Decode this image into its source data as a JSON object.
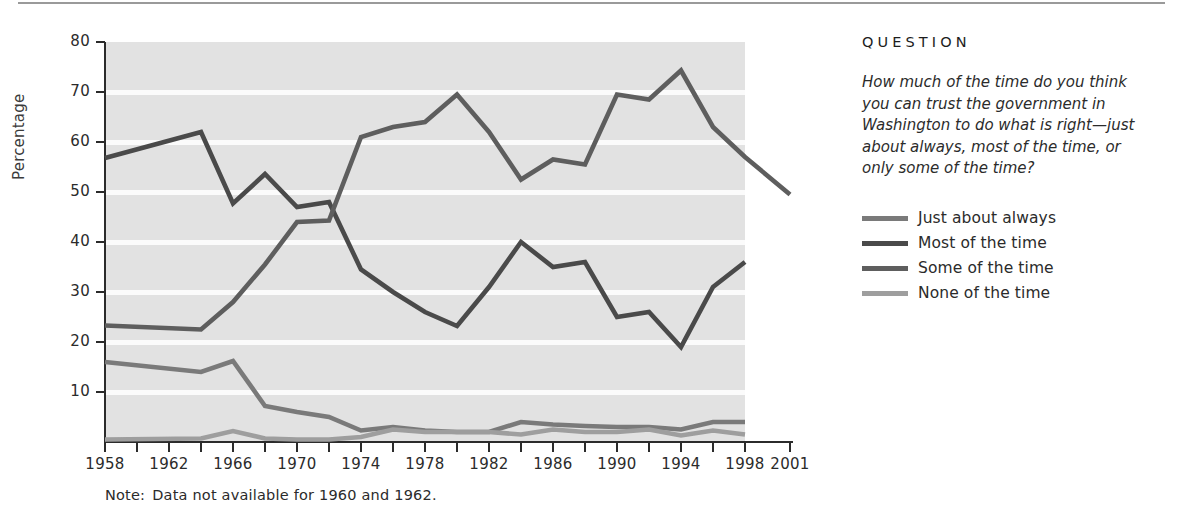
{
  "figure": {
    "note": "Note:  Data not available for 1960 and 1962.",
    "note_lead": "Note:",
    "note_body": "Data not available for 1960 and 1962."
  },
  "side_panel": {
    "heading": "QUESTION",
    "question": "How much of the time do you think you can trust the government in Washington to do what is right—just about always, most of the time, or only some of the time?"
  },
  "colors": {
    "just_about_always": "#7a7a7a",
    "most_of_the_time": "#4a4a4a",
    "some_of_the_time": "#5e5e5e",
    "none_of_the_time": "#9e9e9e",
    "plot_background": "#e2e2e2",
    "gridline": "#fbfbfb",
    "axis": "#2b2b2b"
  },
  "chart_data": {
    "type": "line",
    "title": "",
    "xlabel": "",
    "ylabel": "Percentage",
    "ylim": [
      0,
      80
    ],
    "yticks": [
      10,
      20,
      30,
      40,
      50,
      60,
      70,
      80
    ],
    "ytick_labels": [
      "10",
      "20",
      "30",
      "40",
      "50",
      "60",
      "70",
      "80"
    ],
    "xlim": [
      1958,
      2001
    ],
    "xticks": [
      1958,
      1960,
      1962,
      1964,
      1966,
      1968,
      1970,
      1972,
      1974,
      1976,
      1978,
      1980,
      1982,
      1984,
      1986,
      1988,
      1990,
      1992,
      1994,
      1996,
      1998,
      2001
    ],
    "xtick_labels": [
      "1958",
      "1962",
      "1966",
      "1970",
      "1974",
      "1978",
      "1982",
      "1986",
      "1990",
      "1994",
      "1998",
      "2001"
    ],
    "labeled_xticks": [
      1958,
      1962,
      1966,
      1970,
      1974,
      1978,
      1982,
      1986,
      1990,
      1994,
      1998,
      2001
    ],
    "grid": true,
    "grid_orientation": "horizontal",
    "legend_position": "right",
    "x": [
      1958,
      1964,
      1966,
      1968,
      1970,
      1972,
      1974,
      1976,
      1978,
      1980,
      1982,
      1984,
      1986,
      1988,
      1990,
      1992,
      1994,
      1996,
      1998,
      2001
    ],
    "series": [
      {
        "name": "Just about always",
        "color": "#7a7a7a",
        "values": [
          16.0,
          14.0,
          16.2,
          7.2,
          6.0,
          5.0,
          2.3,
          3.0,
          2.3,
          2.0,
          2.0,
          4.0,
          3.5,
          3.2,
          3.0,
          3.0,
          2.5,
          4.0,
          4.0,
          null
        ]
      },
      {
        "name": "Most of the time",
        "color": "#4a4a4a",
        "values": [
          56.8,
          62.0,
          47.7,
          53.6,
          47.0,
          48.0,
          34.5,
          30.0,
          26.0,
          23.2,
          31.0,
          40.0,
          35.0,
          36.0,
          25.0,
          26.0,
          19.0,
          31.0,
          36.0,
          null
        ]
      },
      {
        "name": "Some of the time",
        "color": "#5e5e5e",
        "values": [
          23.3,
          22.5,
          28.0,
          35.5,
          44.0,
          44.3,
          61.0,
          63.0,
          64.0,
          69.5,
          62.0,
          52.5,
          56.5,
          55.5,
          69.5,
          68.5,
          74.3,
          63.0,
          57.0,
          49.5
        ]
      },
      {
        "name": "None of the time",
        "color": "#9e9e9e",
        "values": [
          0.5,
          0.7,
          2.2,
          0.7,
          0.5,
          0.5,
          1.0,
          2.5,
          2.0,
          2.0,
          2.0,
          1.5,
          2.5,
          2.0,
          2.0,
          2.5,
          1.3,
          2.3,
          1.5,
          null
        ]
      }
    ]
  }
}
